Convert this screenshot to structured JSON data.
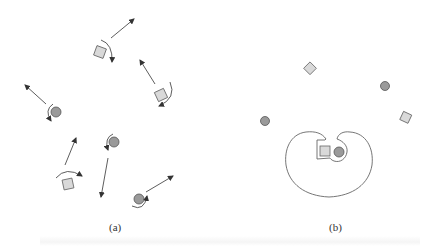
{
  "figure": {
    "panels": [
      {
        "id": "a",
        "label": "(a)",
        "description": "Scattered objects (squares and circles) each with a rotation arrow and a translation arrow",
        "objects": [
          {
            "shape": "square",
            "x": 100,
            "y": 52,
            "rotation": "clockwise"
          },
          {
            "shape": "square",
            "x": 161,
            "y": 95,
            "rotation": "clockwise"
          },
          {
            "shape": "circle",
            "x": 56,
            "y": 112,
            "rotation": "counterclockwise"
          },
          {
            "shape": "square",
            "x": 68,
            "y": 184,
            "rotation": "clockwise"
          },
          {
            "shape": "circle",
            "x": 114,
            "y": 142,
            "rotation": "counterclockwise"
          },
          {
            "shape": "circle",
            "x": 139,
            "y": 199,
            "rotation": "counterclockwise"
          }
        ]
      },
      {
        "id": "b",
        "label": "(b)",
        "description": "Objects scattered with a grasp-shaped enclosure holding a square and a circle",
        "objects": [
          {
            "shape": "diamond",
            "x": 310,
            "y": 69
          },
          {
            "shape": "circle",
            "x": 385,
            "y": 86
          },
          {
            "shape": "circle",
            "x": 265,
            "y": 121
          },
          {
            "shape": "diamond",
            "x": 406,
            "y": 118
          },
          {
            "shape": "square",
            "x": 325,
            "y": 151,
            "enclosed": true
          },
          {
            "shape": "circle",
            "x": 339,
            "y": 152,
            "enclosed": true
          }
        ]
      }
    ],
    "colors": {
      "square_fill": "#d9d9d9",
      "circle_fill": "#9a9a9a",
      "stroke": "#555555",
      "arrow": "#333333"
    }
  }
}
